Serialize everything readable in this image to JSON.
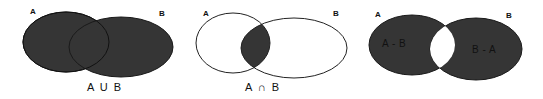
{
  "colors": {
    "fill": "#353535",
    "stroke": "#1a1a1a",
    "background": "#ffffff"
  },
  "diagrams": [
    {
      "id": "union",
      "set_a_label": "A",
      "set_b_label": "B",
      "caption": "A U B",
      "shaded_region": "A ∪ B",
      "ellipse_a": {
        "cx": 66,
        "cy": 42,
        "rx": 43,
        "ry": 30
      },
      "ellipse_b": {
        "cx": 121,
        "cy": 47,
        "rx": 52,
        "ry": 30
      }
    },
    {
      "id": "intersection",
      "set_a_label": "A",
      "set_b_label": "B",
      "caption": "A ∩ B",
      "shaded_region": "A ∩ B",
      "ellipse_a": {
        "cx": 233,
        "cy": 43,
        "rx": 37,
        "ry": 30
      },
      "ellipse_b": {
        "cx": 294,
        "cy": 48,
        "rx": 53,
        "ry": 30
      }
    },
    {
      "id": "difference",
      "set_a_label": "A",
      "set_b_label": "B",
      "region_a_only_label": "A - B",
      "region_b_only_label": "B - A",
      "shaded_region": "(A - B) ∪ (B - A)",
      "ellipse_a": {
        "cx": 412,
        "cy": 45,
        "rx": 43,
        "ry": 30
      },
      "ellipse_b": {
        "cx": 476,
        "cy": 49,
        "rx": 46,
        "ry": 31
      }
    }
  ]
}
